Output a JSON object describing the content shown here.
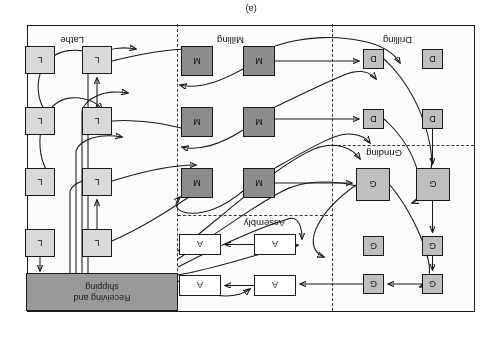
{
  "figure": {
    "caption": "(a)",
    "orientation_degrees": 180,
    "title_banner": {
      "line1": "Receiving and",
      "line2": "shipping"
    },
    "colors": {
      "banner_fill": "#999999",
      "lathe_fill": "#d9d9d9",
      "milling_fill": "#8c8c8c",
      "drilling_fill": "#bfbfbf",
      "grinding_fill": "#bfbfbf",
      "assembly_fill": "#ffffff",
      "outline": "#1a1a1a",
      "dashed_boundary": "#3a3a3a",
      "page_background": "#ffffff"
    }
  },
  "departments": [
    {
      "id": "lathe",
      "label": "Lathe"
    },
    {
      "id": "milling",
      "label": "Milling"
    },
    {
      "id": "drilling",
      "label": "Drilling"
    },
    {
      "id": "grinding",
      "label": "Grinding"
    },
    {
      "id": "assembly",
      "label": "Assembly"
    }
  ],
  "machines": [
    {
      "id": "L1",
      "label": "L",
      "type": "lathe",
      "x": 362,
      "y": 54,
      "w": 30,
      "h": 28
    },
    {
      "id": "L2",
      "label": "L",
      "type": "lathe",
      "x": 419,
      "y": 54,
      "w": 30,
      "h": 28
    },
    {
      "id": "L3",
      "label": "L",
      "type": "lathe",
      "x": 362,
      "y": 115,
      "w": 30,
      "h": 28
    },
    {
      "id": "L4",
      "label": "L",
      "type": "lathe",
      "x": 419,
      "y": 115,
      "w": 30,
      "h": 28
    },
    {
      "id": "L5",
      "label": "L",
      "type": "lathe",
      "x": 362,
      "y": 176,
      "w": 30,
      "h": 28
    },
    {
      "id": "L6",
      "label": "L",
      "type": "lathe",
      "x": 419,
      "y": 176,
      "w": 30,
      "h": 28
    },
    {
      "id": "L7",
      "label": "L",
      "type": "lathe",
      "x": 362,
      "y": 237,
      "w": 30,
      "h": 28
    },
    {
      "id": "L8",
      "label": "L",
      "type": "lathe",
      "x": 419,
      "y": 237,
      "w": 30,
      "h": 28
    },
    {
      "id": "M1",
      "label": "M",
      "type": "milling",
      "x": 199,
      "y": 113,
      "w": 32,
      "h": 30
    },
    {
      "id": "M2",
      "label": "M",
      "type": "milling",
      "x": 261,
      "y": 113,
      "w": 32,
      "h": 30
    },
    {
      "id": "M3",
      "label": "M",
      "type": "milling",
      "x": 199,
      "y": 174,
      "w": 32,
      "h": 30
    },
    {
      "id": "M4",
      "label": "M",
      "type": "milling",
      "x": 261,
      "y": 174,
      "w": 32,
      "h": 30
    },
    {
      "id": "M5",
      "label": "M",
      "type": "milling",
      "x": 199,
      "y": 235,
      "w": 32,
      "h": 30
    },
    {
      "id": "M6",
      "label": "M",
      "type": "milling",
      "x": 261,
      "y": 235,
      "w": 32,
      "h": 30
    },
    {
      "id": "G1",
      "label": "G",
      "type": "grinding",
      "x": 31,
      "y": 17,
      "w": 21,
      "h": 20
    },
    {
      "id": "G2",
      "label": "G",
      "type": "grinding",
      "x": 90,
      "y": 17,
      "w": 21,
      "h": 20
    },
    {
      "id": "G3",
      "label": "G",
      "type": "grinding",
      "x": 31,
      "y": 55,
      "w": 21,
      "h": 20
    },
    {
      "id": "G4",
      "label": "G",
      "type": "grinding",
      "x": 90,
      "y": 55,
      "w": 21,
      "h": 20
    },
    {
      "id": "G5",
      "label": "G",
      "type": "grinding",
      "x": 24,
      "y": 110,
      "w": 34,
      "h": 33
    },
    {
      "id": "G6",
      "label": "G",
      "type": "grinding",
      "x": 84,
      "y": 110,
      "w": 34,
      "h": 33
    },
    {
      "id": "D1",
      "label": "D",
      "type": "drilling",
      "x": 31,
      "y": 182,
      "w": 21,
      "h": 20
    },
    {
      "id": "D2",
      "label": "D",
      "type": "drilling",
      "x": 90,
      "y": 182,
      "w": 21,
      "h": 20
    },
    {
      "id": "D3",
      "label": "D",
      "type": "drilling",
      "x": 31,
      "y": 242,
      "w": 21,
      "h": 20
    },
    {
      "id": "D4",
      "label": "D",
      "type": "drilling",
      "x": 90,
      "y": 242,
      "w": 21,
      "h": 20
    },
    {
      "id": "A1",
      "label": "A",
      "type": "assembly",
      "x": 178,
      "y": 15,
      "w": 42,
      "h": 21
    },
    {
      "id": "A2",
      "label": "A",
      "type": "assembly",
      "x": 253,
      "y": 15,
      "w": 42,
      "h": 21
    },
    {
      "id": "A3",
      "label": "A",
      "type": "assembly",
      "x": 178,
      "y": 56,
      "w": 42,
      "h": 21
    },
    {
      "id": "A4",
      "label": "A",
      "type": "assembly",
      "x": 253,
      "y": 56,
      "w": 42,
      "h": 21
    }
  ],
  "dept_labels": [
    {
      "id": "lathe",
      "text": "Lathe",
      "x": 390,
      "y": 265
    },
    {
      "id": "milling",
      "text": "Milling",
      "x": 230,
      "y": 265
    },
    {
      "id": "drilling",
      "text": "Drilling",
      "x": 62,
      "y": 265
    },
    {
      "id": "grinding",
      "text": "Grinding",
      "x": 72,
      "y": 152
    },
    {
      "id": "assembly",
      "text": "Assembly",
      "x": 189,
      "y": 82
    }
  ],
  "boundaries": {
    "vertical_dashed_x": [
      141,
      296
    ],
    "horizontal_dashed": [
      {
        "x": 0,
        "y": 165,
        "w": 141
      },
      {
        "x": 141,
        "y": 95,
        "w": 155
      }
    ]
  }
}
